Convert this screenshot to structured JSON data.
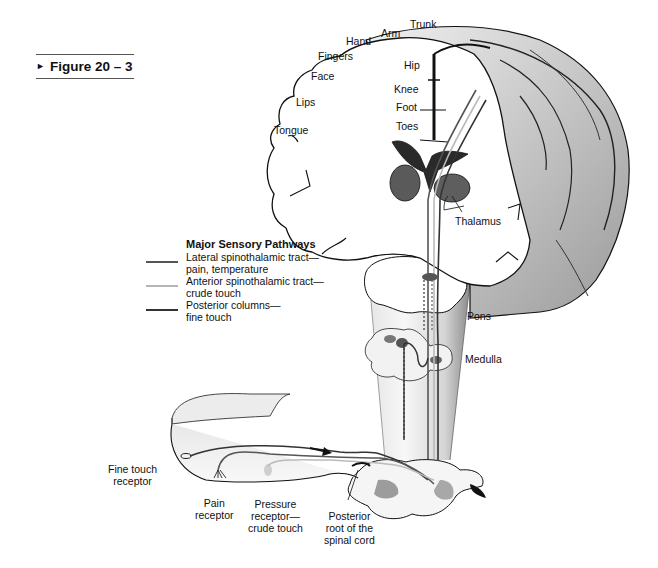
{
  "figure": {
    "label": "Figure 20 – 3",
    "arrow": "►"
  },
  "cortex_labels": {
    "trunk": "Trunk",
    "arm": "Arm",
    "hand": "Hand",
    "fingers": "Fingers",
    "face": "Face",
    "lips": "Lips",
    "tongue": "Tongue",
    "hip": "Hip",
    "knee": "Knee",
    "foot": "Foot",
    "toes": "Toes"
  },
  "structure_labels": {
    "thalamus": "Thalamus",
    "pons": "Pons",
    "medulla": "Medulla"
  },
  "receptor_labels": {
    "fine_touch": [
      "Fine touch",
      "receptor"
    ],
    "pain": [
      "Pain",
      "receptor"
    ],
    "pressure": [
      "Pressure",
      "receptor—",
      "crude touch"
    ],
    "posterior_root": [
      "Posterior",
      "root of the",
      "spinal cord"
    ]
  },
  "legend": {
    "title": "Major Sensory Pathways",
    "items": [
      {
        "line1": "Lateral spinothalamic tract—",
        "line2": "pain, temperature",
        "color": "#555555"
      },
      {
        "line1": "Anterior spinothalamic tract—",
        "line2": "crude touch",
        "color": "#b5b5b5"
      },
      {
        "line1": "Posterior columns—",
        "line2": "fine touch",
        "color": "#333333"
      }
    ]
  },
  "colors": {
    "outline": "#111111",
    "cortex_shade": "#c8c8c8",
    "stem_shade": "#d9d9d9",
    "nucleus": "#555555"
  }
}
